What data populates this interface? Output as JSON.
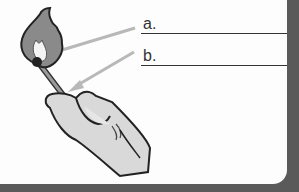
{
  "worksheet": {
    "image_subject": "lit match held in hand",
    "labels": [
      {
        "marker": "a.",
        "answer": "",
        "points_to": "flame"
      },
      {
        "marker": "b.",
        "answer": "",
        "points_to": "match stick"
      }
    ],
    "colors": {
      "frame": "#5a5a5a",
      "card": "#fdfdfd",
      "ink": "#333333",
      "arrow": "#b8b8b8",
      "flame_outer": "#8a8a8a",
      "hand": "#d9d9d9"
    }
  }
}
